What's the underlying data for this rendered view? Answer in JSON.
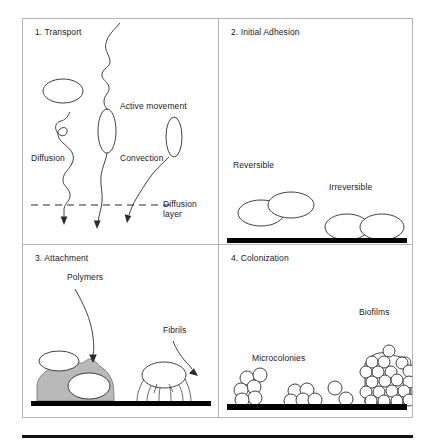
{
  "figure": {
    "kind": "biofilm-formation-stages-diagram",
    "panel_count": 4
  },
  "panels": [
    {
      "id": "transport",
      "title": "1. Transport",
      "labels": {
        "diffusion": "Diffusion",
        "active_movement": "Active movement",
        "convection": "Convection",
        "diffusion_layer_line1": "Diffusion",
        "diffusion_layer_line2": "layer"
      }
    },
    {
      "id": "initial-adhesion",
      "title": "2. Initial Adhesion",
      "labels": {
        "reversible": "Reversible",
        "irreversible": "Irreversible"
      }
    },
    {
      "id": "attachment",
      "title": "3. Attachment",
      "labels": {
        "polymers": "Polymers",
        "fibrils": "Fibrils"
      }
    },
    {
      "id": "colonization",
      "title": "4. Colonization",
      "labels": {
        "microcolonies": "Microcolonies",
        "biofilms": "Biofilms"
      }
    }
  ],
  "colors": {
    "ink": "#2b2b2b",
    "panel_border": "#b5b5b5",
    "surface": "#000000",
    "polymer_fill": "#b9b9b9",
    "cell_fill": "#ffffff"
  }
}
